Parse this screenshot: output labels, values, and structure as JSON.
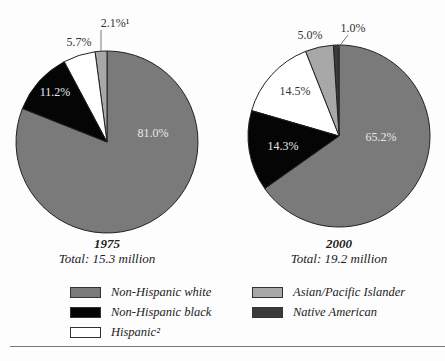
{
  "chart_data": [
    {
      "type": "pie",
      "title": "1975",
      "subtitle": "Total: 15.3 million",
      "categories": [
        "Non-Hispanic white",
        "Non-Hispanic black",
        "Hispanic",
        "Asian/Pacific Islander"
      ],
      "values": [
        81.0,
        11.2,
        5.7,
        2.1
      ],
      "labels": [
        "81.0%",
        "11.2%",
        "5.7%",
        "2.1%¹"
      ],
      "colors": [
        "#7a7a7a",
        "#050505",
        "#ffffff",
        "#a8a8a8"
      ]
    },
    {
      "type": "pie",
      "title": "2000",
      "subtitle": "Total: 19.2 million",
      "categories": [
        "Non-Hispanic white",
        "Non-Hispanic black",
        "Hispanic",
        "Asian/Pacific Islander",
        "Native American"
      ],
      "values": [
        65.2,
        14.3,
        14.5,
        5.0,
        1.0
      ],
      "labels": [
        "65.2%",
        "14.3%",
        "14.5%",
        "5.0%",
        "1.0%"
      ],
      "colors": [
        "#7a7a7a",
        "#050505",
        "#ffffff",
        "#a8a8a8",
        "#3a3a3a"
      ]
    }
  ],
  "captions": {
    "left": {
      "year": "1975",
      "total": "Total: 15.3 million"
    },
    "right": {
      "year": "2000",
      "total": "Total: 19.2 million"
    }
  },
  "legend": [
    {
      "label": "Non-Hispanic white",
      "color": "#7a7a7a"
    },
    {
      "label": "Non-Hispanic black",
      "color": "#050505"
    },
    {
      "label": "Hispanic²",
      "color": "#ffffff"
    },
    {
      "label": "Asian/Pacific Islander",
      "color": "#a8a8a8"
    },
    {
      "label": "Native American",
      "color": "#3a3a3a"
    }
  ]
}
